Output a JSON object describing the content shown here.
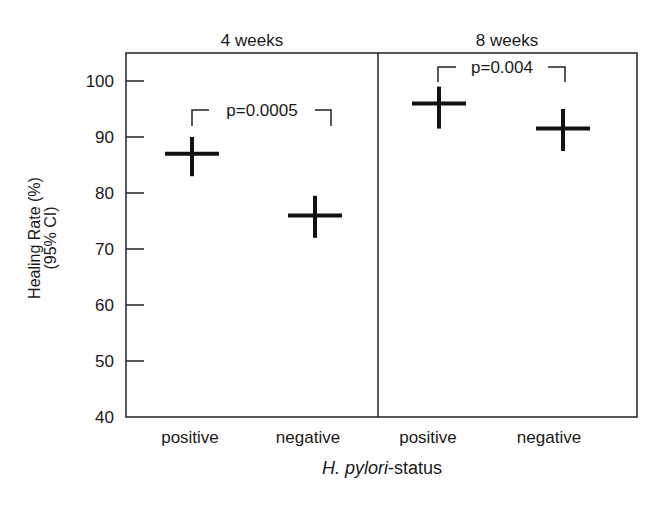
{
  "chart_data": {
    "type": "scatter",
    "subtype": "point-estimate-with-95ci",
    "title": "",
    "panels": [
      {
        "title": "4 weeks",
        "categories": [
          "positive",
          "negative"
        ],
        "values": [
          87,
          76
        ],
        "ci_upper": [
          90,
          79.5
        ],
        "ci_lower": [
          83,
          72
        ],
        "annotation": "p=0.0005"
      },
      {
        "title": "8 weeks",
        "categories": [
          "positive",
          "negative"
        ],
        "values": [
          96,
          91.5
        ],
        "ci_upper": [
          99,
          95
        ],
        "ci_lower": [
          91.5,
          87.5
        ],
        "annotation": "p=0.004"
      }
    ],
    "xlabel_italic": "H. pylori",
    "xlabel_rest": "-status",
    "ylabel_line1": "Healing Rate (%)",
    "ylabel_line2": "(95% CI)",
    "ylim": [
      40,
      105
    ],
    "yticks": [
      40,
      50,
      60,
      70,
      80,
      90,
      100
    ],
    "grid": false,
    "legend": "none",
    "marker_color": "#111111"
  }
}
